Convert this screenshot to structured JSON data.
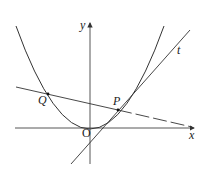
{
  "diagram": {
    "type": "coordinate-geometry",
    "labels": {
      "x_axis": "x",
      "y_axis": "y",
      "origin": "O",
      "point_P": "P",
      "point_Q": "Q",
      "tangent": "t"
    },
    "colors": {
      "stroke": "#333333",
      "background": "#ffffff"
    }
  }
}
